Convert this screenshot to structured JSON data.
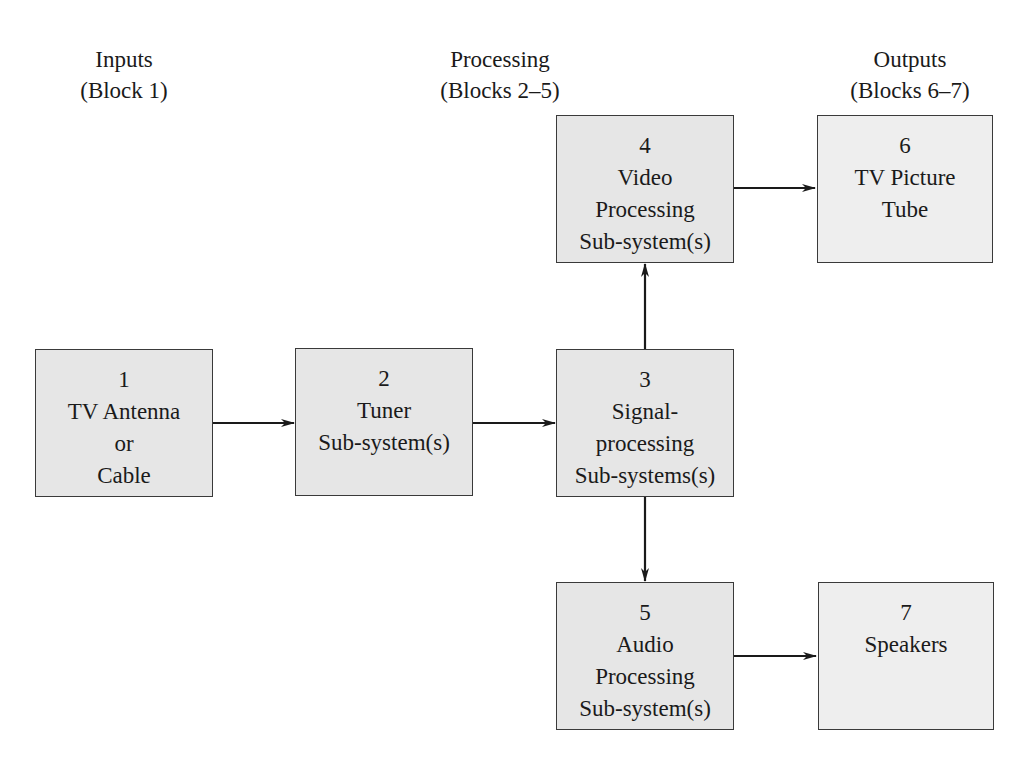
{
  "headers": [
    {
      "line1": "Inputs",
      "line2": "(Block 1)"
    },
    {
      "line1": "Processing",
      "line2": "(Blocks 2–5)"
    },
    {
      "line1": "Outputs",
      "line2": "(Blocks 6–7)"
    }
  ],
  "blocks": {
    "b1": {
      "num": "1",
      "lines": [
        "TV Antenna",
        "or",
        "Cable"
      ]
    },
    "b2": {
      "num": "2",
      "lines": [
        "Tuner",
        "Sub-system(s)"
      ]
    },
    "b3": {
      "num": "3",
      "lines": [
        "Signal-",
        "processing",
        "Sub-systems(s)"
      ]
    },
    "b4": {
      "num": "4",
      "lines": [
        "Video",
        "Processing",
        "Sub-system(s)"
      ]
    },
    "b5": {
      "num": "5",
      "lines": [
        "Audio",
        "Processing",
        "Sub-system(s)"
      ]
    },
    "b6": {
      "num": "6",
      "lines": [
        "TV Picture",
        "Tube"
      ]
    },
    "b7": {
      "num": "7",
      "lines": [
        "Speakers"
      ]
    }
  },
  "connections": [
    {
      "from": "1",
      "to": "2"
    },
    {
      "from": "2",
      "to": "3"
    },
    {
      "from": "3",
      "to": "4"
    },
    {
      "from": "3",
      "to": "5"
    },
    {
      "from": "4",
      "to": "6"
    },
    {
      "from": "5",
      "to": "7"
    }
  ],
  "colors": {
    "box_fill": "#e6e6e6",
    "output_fill": "#eeeeee",
    "stroke": "#1a1a1a"
  }
}
